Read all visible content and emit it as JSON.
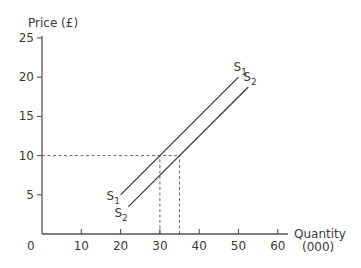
{
  "chart_data": {
    "type": "line",
    "title": "",
    "ylabel": "Price (£)",
    "xlabel": "Quantity",
    "xlabel_unit": "(000)",
    "xlim": [
      0,
      60
    ],
    "ylim": [
      0,
      25
    ],
    "origin_label": "0",
    "x_ticks": [
      10,
      20,
      30,
      40,
      50,
      60
    ],
    "y_ticks": [
      5,
      10,
      15,
      20,
      25
    ],
    "grid": false,
    "series": [
      {
        "name": "S1",
        "label_main": "S",
        "label_sub": "1",
        "points": [
          [
            20,
            5
          ],
          [
            50,
            20
          ]
        ]
      },
      {
        "name": "S2",
        "label_main": "S",
        "label_sub": "2",
        "points": [
          [
            22,
            3.5
          ],
          [
            52.5,
            18.75
          ]
        ]
      }
    ],
    "annotations": [
      {
        "type": "dashed-horizontal",
        "y": 10,
        "x_from": 0,
        "x_to": 35
      },
      {
        "type": "dashed-vertical",
        "x": 30,
        "y_from": 0,
        "y_to": 10
      },
      {
        "type": "dashed-vertical",
        "x": 35,
        "y_from": 0,
        "y_to": 10
      }
    ]
  }
}
